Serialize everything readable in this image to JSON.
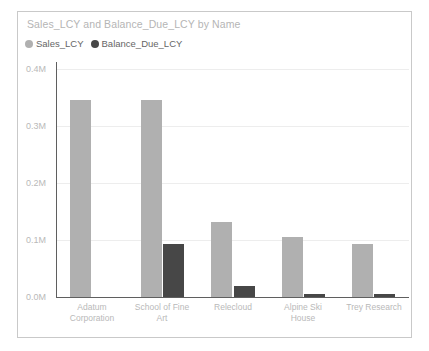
{
  "card": {
    "title": "Sales_LCY and Balance_Due_LCY by Name",
    "border_color": "#c9c9c9",
    "background": "#ffffff"
  },
  "legend": {
    "position": "top-left",
    "items": [
      {
        "label": "Sales_LCY",
        "color": "#b0b0b0",
        "icon": "legend-dot-icon"
      },
      {
        "label": "Balance_Due_LCY",
        "color": "#474747",
        "icon": "legend-dot-icon"
      }
    ]
  },
  "chart_data": {
    "type": "bar",
    "title": "Sales_LCY and Balance_Due_LCY by Name",
    "xlabel": "",
    "ylabel": "",
    "grid": true,
    "legend_position": "top-left",
    "ylim": [
      0,
      0.4
    ],
    "yticks": [
      0.0,
      0.1,
      0.2,
      0.3,
      0.4
    ],
    "ytick_labels": [
      "0.0M",
      "0.1M",
      "0.2M",
      "0.3M",
      "0.4M"
    ],
    "categories": [
      "Adatum Corporation",
      "School of Fine Art",
      "Relecloud",
      "Alpine Ski House",
      "Trey Research"
    ],
    "category_lines": [
      [
        "Adatum",
        "Corporation"
      ],
      [
        "School of Fine",
        "Art"
      ],
      [
        "Relecloud",
        ""
      ],
      [
        "Alpine Ski",
        "House"
      ],
      [
        "Trey Research",
        ""
      ]
    ],
    "series": [
      {
        "name": "Sales_LCY",
        "color": "#b0b0b0",
        "values": [
          0.345,
          0.345,
          0.132,
          0.105,
          0.093
        ]
      },
      {
        "name": "Balance_Due_LCY",
        "color": "#474747",
        "values": [
          0.0,
          0.093,
          0.019,
          0.005,
          0.005
        ]
      }
    ]
  }
}
